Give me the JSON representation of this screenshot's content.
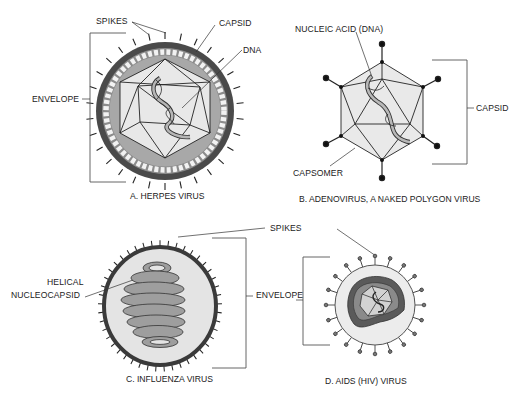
{
  "panels": {
    "a": {
      "caption": "A. HERPES VIRUS",
      "labels": {
        "spikes": "SPIKES",
        "capsid": "CAPSID",
        "dna": "DNA",
        "envelope": "ENVELOPE"
      }
    },
    "b": {
      "caption": "B. ADENOVIRUS, A NAKED POLYGON VIRUS",
      "labels": {
        "nucleic_acid": "NUCLEIC ACID (DNA)",
        "capsid": "CAPSID",
        "capsomer": "CAPSOMER"
      }
    },
    "c": {
      "caption": "C. INFLUENZA VIRUS",
      "labels": {
        "helical_line1": "HELICAL",
        "helical_line2": "NUCLEOCAPSID"
      }
    },
    "d": {
      "caption": "D. AIDS (HIV) VIRUS",
      "labels": {
        "envelope": "ENVELOPE"
      }
    },
    "shared": {
      "spikes": "SPIKES"
    }
  },
  "colors": {
    "envelope_dark": "#4a4a4a",
    "capsid_mid": "#9a9a9a",
    "capsid_light": "#e6e6e6",
    "influenza_fill": "#e4e4e4",
    "hiv_fill": "#ececec",
    "hiv_core": "#5a5a5a"
  }
}
